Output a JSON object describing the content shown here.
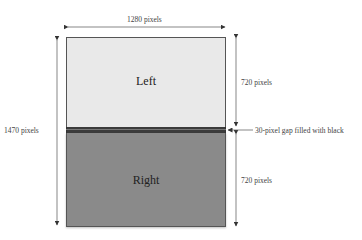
{
  "diagram": {
    "width_label": "1280 pixels",
    "total_height_label": "1470 pixels",
    "top_height_label": "720 pixels",
    "bottom_height_label": "720 pixels",
    "gap_label": "30-pixel gap filled with black",
    "top_panel_label": "Left",
    "bottom_panel_label": "Right",
    "colors": {
      "top_panel": "#e9e9e9",
      "gap": "#3b3b3b",
      "bottom_panel": "#8a8a8a"
    }
  }
}
